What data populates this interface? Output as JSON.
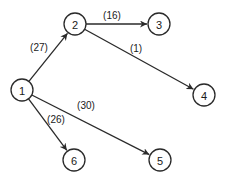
{
  "diagram": {
    "type": "directed-weighted-graph",
    "nodes": [
      {
        "id": "1",
        "label": "1",
        "x": 22,
        "y": 90
      },
      {
        "id": "2",
        "label": "2",
        "x": 75,
        "y": 24
      },
      {
        "id": "3",
        "label": "3",
        "x": 159,
        "y": 24
      },
      {
        "id": "4",
        "label": "4",
        "x": 204,
        "y": 95
      },
      {
        "id": "5",
        "label": "5",
        "x": 160,
        "y": 160
      },
      {
        "id": "6",
        "label": "6",
        "x": 74,
        "y": 160
      }
    ],
    "edges": [
      {
        "from": "1",
        "to": "2",
        "label": "(27)",
        "lx": 39,
        "ly": 47
      },
      {
        "from": "2",
        "to": "3",
        "label": "(16)",
        "lx": 112,
        "ly": 15
      },
      {
        "from": "2",
        "to": "4",
        "label": "(1)",
        "lx": 136,
        "ly": 48
      },
      {
        "from": "1",
        "to": "5",
        "label": "(30)",
        "lx": 86,
        "ly": 105
      },
      {
        "from": "1",
        "to": "6",
        "label": "(26)",
        "lx": 56,
        "ly": 119
      }
    ],
    "colors": {
      "stroke": "#2a2a2a",
      "background": "#ffffff"
    }
  }
}
